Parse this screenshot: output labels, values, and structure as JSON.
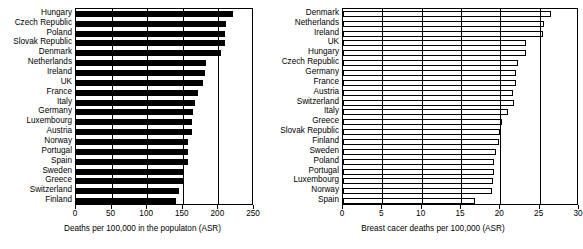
{
  "chart_data": [
    {
      "id": "all-cause-mortality",
      "type": "bar",
      "orientation": "horizontal",
      "title": "",
      "xlabel": "Deaths per 100,000 in the populaton (ASR)",
      "ylabel": "",
      "xlim": [
        0,
        250
      ],
      "xticks": [
        0,
        50,
        100,
        150,
        200,
        250
      ],
      "xtick_labels": [
        "0",
        "50",
        "100",
        "150",
        "200",
        "250"
      ],
      "grid": true,
      "grid_axis": "x",
      "bar_style": "filled-black",
      "legend": "none",
      "categories": [
        "Hungary",
        "Czech Republic",
        "Poland",
        "Slovak Republic",
        "Denmark",
        "Netherlands",
        "Ireland",
        "UK",
        "France",
        "Italy",
        "Germany",
        "Luxembourg",
        "Austria",
        "Norway",
        "Portugal",
        "Spain",
        "Sweden",
        "Greece",
        "Switzerland",
        "Finland"
      ],
      "values": [
        221,
        210,
        209,
        209,
        203,
        182,
        181,
        179,
        172,
        167,
        164,
        163,
        163,
        158,
        158,
        157,
        151,
        150,
        145,
        141
      ]
    },
    {
      "id": "breast-cancer-mortality",
      "type": "bar",
      "orientation": "horizontal",
      "title": "",
      "xlabel": "Breast cacer deaths per 100,000 (ASR)",
      "ylabel": "",
      "xlim": [
        0,
        30
      ],
      "xticks": [
        0,
        5,
        10,
        15,
        20,
        25,
        30
      ],
      "xtick_labels": [
        "0",
        "5",
        "10",
        "15",
        "20",
        "25",
        "30"
      ],
      "grid": true,
      "grid_axis": "x",
      "bar_style": "hollow-outline",
      "legend": "none",
      "categories": [
        "Denmark",
        "Netherlands",
        "Ireland",
        "UK",
        "Hungary",
        "Czech Republic",
        "Germany",
        "France",
        "Austria",
        "Switzerland",
        "Italy",
        "Greece",
        "Slovak Republic",
        "Finland",
        "Sweden",
        "Poland",
        "Portugal",
        "Luxembourg",
        "Norway",
        "Spain"
      ],
      "values": [
        26.4,
        25.5,
        25.4,
        23.2,
        23.2,
        22.3,
        22.0,
        22.0,
        21.6,
        21.8,
        21.0,
        20.2,
        20.0,
        19.8,
        19.5,
        19.2,
        19.2,
        19.1,
        18.9,
        16.8
      ]
    }
  ],
  "panels": {
    "left": {
      "axis_title": "Deaths per 100,000 in the populaton (ASR)",
      "tick_labels": [
        "0",
        "50",
        "100",
        "150",
        "200",
        "250"
      ],
      "categories": [
        "Hungary",
        "Czech Republic",
        "Poland",
        "Slovak Republic",
        "Denmark",
        "Netherlands",
        "Ireland",
        "UK",
        "France",
        "Italy",
        "Germany",
        "Luxembourg",
        "Austria",
        "Norway",
        "Portugal",
        "Spain",
        "Sweden",
        "Greece",
        "Switzerland",
        "Finland"
      ]
    },
    "right": {
      "axis_title": "Breast cacer deaths per 100,000 (ASR)",
      "tick_labels": [
        "0",
        "5",
        "10",
        "15",
        "20",
        "25",
        "30"
      ],
      "categories": [
        "Denmark",
        "Netherlands",
        "Ireland",
        "UK",
        "Hungary",
        "Czech Republic",
        "Germany",
        "France",
        "Austria",
        "Switzerland",
        "Italy",
        "Greece",
        "Slovak Republic",
        "Finland",
        "Sweden",
        "Poland",
        "Portugal",
        "Luxembourg",
        "Norway",
        "Spain"
      ]
    }
  },
  "colors": {
    "bar_left": "#000000",
    "bar_right_fill": "#ffffff",
    "bar_right_stroke": "#000000",
    "axis": "#000000",
    "background": "#ffffff"
  }
}
